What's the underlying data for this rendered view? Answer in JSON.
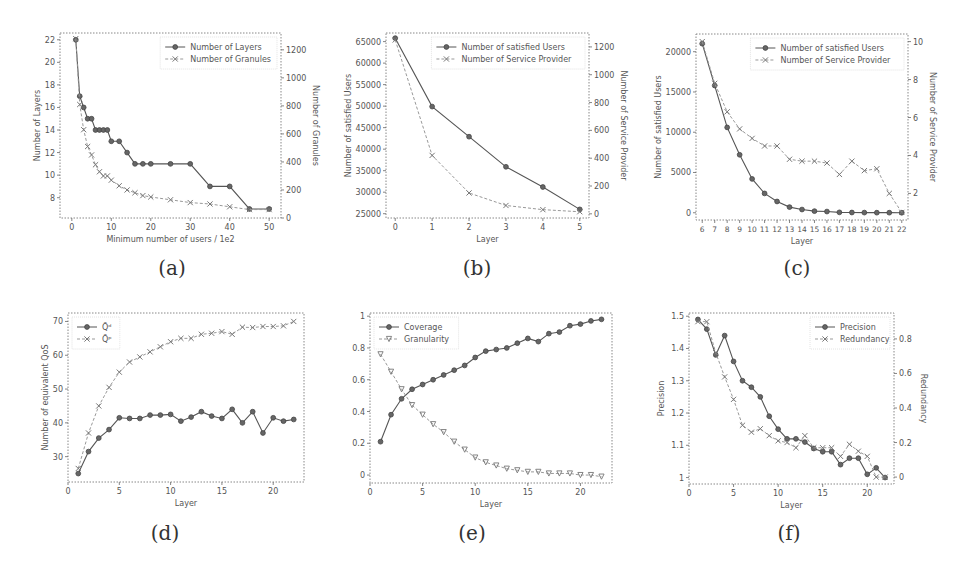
{
  "figure": {
    "captions": [
      "(a)",
      "(b)",
      "(c)",
      "(d)",
      "(e)",
      "(f)"
    ]
  },
  "chart_data": [
    {
      "id": "a",
      "type": "line",
      "box": [
        60,
        33,
        281,
        218
      ],
      "title": "",
      "xlabel": "Minimum number of users / 1e2",
      "ylabel": "Number of Layers",
      "y2label": "Number of Granules",
      "xlim": [
        -3,
        53
      ],
      "ylim": [
        6.2,
        22.6
      ],
      "y2lim": [
        0,
        1320
      ],
      "xticks": [
        0,
        10,
        20,
        30,
        40,
        50
      ],
      "yticks": [
        8,
        10,
        12,
        14,
        16,
        18,
        20,
        22
      ],
      "y2ticks": [
        0,
        200,
        400,
        600,
        800,
        1000,
        1200
      ],
      "grid": false,
      "legend_position": "upper right",
      "series": [
        {
          "name": "Number of Layers",
          "axis": "left",
          "style": "solid",
          "marker": "o",
          "x": [
            1,
            2,
            3,
            4,
            5,
            6,
            7,
            8,
            9,
            10,
            12,
            14,
            16,
            18,
            20,
            25,
            30,
            35,
            40,
            45,
            50
          ],
          "y": [
            22,
            17,
            16,
            15,
            15,
            14,
            14,
            14,
            14,
            13,
            13,
            12,
            11,
            11,
            11,
            11,
            11,
            9,
            9,
            7,
            7
          ]
        },
        {
          "name": "Number of Granules",
          "axis": "right",
          "style": "dashed",
          "marker": "x",
          "x": [
            1,
            2,
            3,
            4,
            5,
            6,
            7,
            8,
            9,
            10,
            12,
            14,
            16,
            18,
            20,
            25,
            30,
            35,
            40,
            45,
            50
          ],
          "y": [
            1280,
            810,
            630,
            510,
            450,
            380,
            330,
            300,
            300,
            270,
            230,
            200,
            180,
            160,
            150,
            130,
            110,
            100,
            80,
            60,
            60
          ]
        }
      ]
    },
    {
      "id": "b",
      "type": "line",
      "box": [
        386,
        33,
        589,
        218
      ],
      "title": "",
      "xlabel": "Layer",
      "ylabel": "Number of satisfied Users",
      "y2label": "Number of Service Provider",
      "xlim": [
        -0.25,
        5.25
      ],
      "ylim": [
        24000,
        67000
      ],
      "y2lim": [
        -30,
        1300
      ],
      "xticks": [
        0,
        1,
        2,
        3,
        4,
        5
      ],
      "yticks": [
        25000,
        30000,
        35000,
        40000,
        45000,
        50000,
        55000,
        60000,
        65000
      ],
      "y2ticks": [
        0,
        200,
        400,
        600,
        800,
        1000,
        1200
      ],
      "grid": false,
      "legend_position": "upper right",
      "series": [
        {
          "name": "Number of satisfied Users",
          "axis": "left",
          "style": "solid",
          "marker": "o",
          "x": [
            0,
            1,
            2,
            3,
            4,
            5
          ],
          "y": [
            65800,
            49900,
            42900,
            35900,
            31200,
            26000
          ]
        },
        {
          "name": "Number of Service Provider",
          "axis": "right",
          "style": "dashed",
          "marker": "x",
          "x": [
            0,
            1,
            2,
            3,
            4,
            5
          ],
          "y": [
            1250,
            420,
            150,
            60,
            30,
            15
          ]
        }
      ]
    },
    {
      "id": "c",
      "type": "line",
      "box": [
        696,
        34,
        908,
        220
      ],
      "title": "",
      "xlabel": "Layer",
      "ylabel": "Number of satisfied Users",
      "y2label": "Number of Service Provider",
      "xlim": [
        5.5,
        22.5
      ],
      "ylim": [
        -900,
        22200
      ],
      "y2lim": [
        0.6,
        10.4
      ],
      "xticks": [
        6,
        7,
        8,
        9,
        10,
        11,
        12,
        13,
        14,
        15,
        16,
        17,
        18,
        19,
        20,
        21,
        22
      ],
      "yticks": [
        0,
        5000,
        10000,
        15000,
        20000
      ],
      "y2ticks": [
        2,
        4,
        6,
        8,
        10
      ],
      "grid": false,
      "legend_position": "upper right",
      "series": [
        {
          "name": "Number of satisfied Users",
          "axis": "left",
          "style": "solid",
          "marker": "o",
          "x": [
            6,
            7,
            8,
            9,
            10,
            11,
            12,
            13,
            14,
            15,
            16,
            17,
            18,
            19,
            20,
            21,
            22
          ],
          "y": [
            21000,
            15800,
            10600,
            7200,
            4200,
            2400,
            1400,
            700,
            400,
            200,
            150,
            50,
            30,
            20,
            10,
            10,
            0
          ]
        },
        {
          "name": "Number of Service Provider",
          "axis": "right",
          "style": "dashed",
          "marker": "x",
          "x": [
            6,
            7,
            8,
            9,
            10,
            11,
            12,
            13,
            14,
            15,
            16,
            17,
            18,
            19,
            20,
            21,
            22
          ],
          "y": [
            10,
            7.8,
            6.3,
            5.4,
            4.9,
            4.5,
            4.5,
            3.8,
            3.7,
            3.7,
            3.6,
            3.0,
            3.7,
            3.2,
            3.3,
            2.0,
            1.0
          ]
        }
      ]
    },
    {
      "id": "d",
      "type": "line",
      "box": [
        68,
        313,
        304,
        482
      ],
      "title": "",
      "xlabel": "Layer",
      "ylabel": "Number of equivalent QoS",
      "xlim": [
        0,
        23
      ],
      "ylim": [
        22.5,
        72.5
      ],
      "xticks": [
        0,
        5,
        10,
        15,
        20
      ],
      "yticks": [
        30,
        40,
        50,
        60,
        70
      ],
      "grid": false,
      "legend_position": "upper left",
      "series": [
        {
          "name": "Q̃ᵈ",
          "style": "solid",
          "marker": "o",
          "x": [
            1,
            2,
            3,
            4,
            5,
            6,
            7,
            8,
            9,
            10,
            11,
            12,
            13,
            14,
            15,
            16,
            17,
            18,
            19,
            20,
            21,
            22
          ],
          "y": [
            25,
            31.5,
            35.5,
            38,
            41.5,
            41.3,
            41.3,
            42.3,
            42.3,
            42.5,
            40.5,
            41.7,
            43.3,
            42,
            41.3,
            44,
            40,
            43.3,
            37,
            41.5,
            40.5,
            41
          ]
        },
        {
          "name": "Q̃ᵖ",
          "style": "dashed",
          "marker": "x",
          "x": [
            1,
            2,
            3,
            4,
            5,
            6,
            7,
            8,
            9,
            10,
            11,
            12,
            13,
            14,
            15,
            16,
            17,
            18,
            19,
            20,
            21,
            22
          ],
          "y": [
            26.5,
            37,
            45,
            50.5,
            55,
            58,
            59.5,
            61,
            62.5,
            64,
            65,
            65,
            66.2,
            66.5,
            67,
            66.2,
            68.3,
            68.2,
            68.5,
            68.5,
            68.7,
            70
          ]
        }
      ]
    },
    {
      "id": "e",
      "type": "line",
      "box": [
        370,
        313,
        612,
        483
      ],
      "title": "",
      "xlabel": "Layer",
      "ylabel": "",
      "xlim": [
        0,
        23
      ],
      "ylim": [
        -0.05,
        1.02
      ],
      "xticks": [
        0,
        5,
        10,
        15,
        20
      ],
      "yticks": [
        0.0,
        0.2,
        0.4,
        0.6,
        0.8,
        1.0
      ],
      "grid": false,
      "legend_position": "upper left",
      "series": [
        {
          "name": "Coverage",
          "style": "solid",
          "marker": "o",
          "x": [
            1,
            2,
            3,
            4,
            5,
            6,
            7,
            8,
            9,
            10,
            11,
            12,
            13,
            14,
            15,
            16,
            17,
            18,
            19,
            20,
            21,
            22
          ],
          "y": [
            0.21,
            0.38,
            0.48,
            0.54,
            0.57,
            0.6,
            0.63,
            0.66,
            0.69,
            0.74,
            0.78,
            0.79,
            0.8,
            0.83,
            0.86,
            0.84,
            0.89,
            0.9,
            0.94,
            0.95,
            0.97,
            0.98
          ]
        },
        {
          "name": "Granularity",
          "style": "dashed",
          "marker": "v",
          "x": [
            1,
            2,
            3,
            4,
            5,
            6,
            7,
            8,
            9,
            10,
            11,
            12,
            13,
            14,
            15,
            16,
            17,
            18,
            19,
            20,
            21,
            22
          ],
          "y": [
            0.76,
            0.65,
            0.54,
            0.44,
            0.38,
            0.32,
            0.27,
            0.21,
            0.16,
            0.11,
            0.08,
            0.06,
            0.04,
            0.03,
            0.02,
            0.02,
            0.01,
            0.01,
            0.01,
            0.0,
            0.0,
            -0.01
          ]
        }
      ]
    },
    {
      "id": "f",
      "type": "line",
      "box": [
        689,
        313,
        894,
        484
      ],
      "title": "",
      "xlabel": "Layer",
      "ylabel": "Precision",
      "y2label": "Redundancy",
      "xlim": [
        0,
        23
      ],
      "ylim": [
        0.98,
        1.51
      ],
      "y2lim": [
        -0.04,
        0.95
      ],
      "xticks": [
        0,
        5,
        10,
        15,
        20
      ],
      "yticks": [
        1.0,
        1.1,
        1.2,
        1.3,
        1.4,
        1.5
      ],
      "y2ticks": [
        0.0,
        0.2,
        0.4,
        0.6,
        0.8
      ],
      "grid": false,
      "legend_position": "upper right",
      "series": [
        {
          "name": "Precision",
          "axis": "left",
          "style": "solid",
          "marker": "o",
          "x": [
            1,
            2,
            3,
            4,
            5,
            6,
            7,
            8,
            9,
            10,
            11,
            12,
            13,
            14,
            15,
            16,
            17,
            18,
            19,
            20,
            21,
            22
          ],
          "y": [
            1.49,
            1.46,
            1.38,
            1.44,
            1.36,
            1.3,
            1.28,
            1.25,
            1.19,
            1.15,
            1.12,
            1.12,
            1.11,
            1.09,
            1.08,
            1.08,
            1.04,
            1.06,
            1.06,
            1.01,
            1.03,
            1.0
          ]
        },
        {
          "name": "Redundancy",
          "axis": "right",
          "style": "dashed",
          "marker": "x",
          "x": [
            1,
            2,
            3,
            4,
            5,
            6,
            7,
            8,
            9,
            10,
            11,
            12,
            13,
            14,
            15,
            16,
            17,
            18,
            19,
            20,
            21,
            22
          ],
          "y": [
            0.9,
            0.9,
            0.72,
            0.58,
            0.45,
            0.3,
            0.26,
            0.28,
            0.24,
            0.21,
            0.2,
            0.17,
            0.24,
            0.17,
            0.17,
            0.17,
            0.12,
            0.19,
            0.15,
            0.12,
            0.0,
            0.0
          ]
        }
      ]
    }
  ]
}
